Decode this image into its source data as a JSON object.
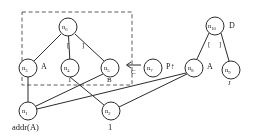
{
  "diagram": {
    "type": "dag-pointer-graph",
    "nodes": [
      {
        "id": "n1",
        "label": "n",
        "sub": "1",
        "cx": 28,
        "cy": 111,
        "r": 9,
        "side_label": "",
        "below_label": "addr(A)"
      },
      {
        "id": "n2",
        "label": "n",
        "sub": "2",
        "cx": 111,
        "cy": 111,
        "r": 9,
        "side_label": "",
        "below_label": "1"
      },
      {
        "id": "n3",
        "label": "n",
        "sub": "3",
        "cx": 28,
        "cy": 68,
        "r": 9,
        "side_label": "A",
        "below_label": ""
      },
      {
        "id": "n4",
        "label": "n",
        "sub": "4",
        "cx": 70,
        "cy": 68,
        "r": 9,
        "side_label": "",
        "below_label": "1"
      },
      {
        "id": "n5",
        "label": "n",
        "sub": "5",
        "cx": 110,
        "cy": 68,
        "r": 9,
        "side_label": "",
        "below_label": "B"
      },
      {
        "id": "n6",
        "label": "n",
        "sub": "6",
        "cx": 68,
        "cy": 27,
        "r": 9,
        "side_label": "",
        "below_label": ""
      },
      {
        "id": "n7",
        "label": "n",
        "sub": "7",
        "cx": 153,
        "cy": 68,
        "r": 9,
        "side_label": "P↑",
        "below_label": ""
      },
      {
        "id": "n8",
        "label": "n",
        "sub": "8",
        "cx": 194,
        "cy": 68,
        "r": 9,
        "side_label": "A",
        "below_label": ""
      },
      {
        "id": "n9",
        "label": "n",
        "sub": "9",
        "cx": 231,
        "cy": 70,
        "r": 9,
        "side_label": "",
        "below_label": "J"
      },
      {
        "id": "n10",
        "label": "n",
        "sub": "10",
        "cx": 215,
        "cy": 26,
        "r": 9,
        "side_label": "D",
        "below_label": ""
      }
    ],
    "edges": [
      {
        "from": "n6",
        "to": "n3",
        "label": ""
      },
      {
        "from": "n6",
        "to": "n4",
        "label": "["
      },
      {
        "from": "n6",
        "to": "n5",
        "label": "]"
      },
      {
        "from": "n3",
        "to": "n1",
        "label": ""
      },
      {
        "from": "n4",
        "to": "n2",
        "label": ""
      },
      {
        "from": "n5",
        "to": "n1",
        "label": ""
      },
      {
        "from": "n2",
        "to": "n8",
        "label": ""
      },
      {
        "from": "n1",
        "to": "n8",
        "label": ""
      },
      {
        "from": "n10",
        "to": "n8",
        "label": "["
      },
      {
        "from": "n10",
        "to": "n9",
        "label": "]"
      }
    ],
    "annotations": [
      {
        "name": "pointer-arrow-c",
        "text": "C",
        "arrow": "←"
      },
      {
        "name": "pointer-label-p",
        "text": "P↑"
      }
    ],
    "dashed_box": {
      "x": 22,
      "y": 12,
      "w": 110,
      "h": 73
    },
    "colors": {
      "stroke": "#2b2b2b",
      "text": "#1a1a1a",
      "background": "#ffffff",
      "dashed": "#4a4a4a"
    }
  }
}
